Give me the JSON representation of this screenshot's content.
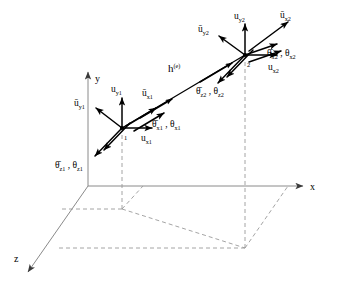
{
  "figure": {
    "type": "3d-beam-element-dof-diagram"
  },
  "axes": {
    "x_label": "x",
    "y_label": "y",
    "z_label": "z",
    "origin_label": ""
  },
  "element": {
    "length_label": "h",
    "length_superscript": "(e)",
    "node1_number": "1",
    "node2_number": "2"
  },
  "node1_dofs": {
    "u_y_bar": {
      "base": "u",
      "bar": true,
      "sub": "y1"
    },
    "u_y": {
      "base": "u",
      "bar": false,
      "sub": "y1"
    },
    "u_x_bar": {
      "base": "u",
      "bar": true,
      "sub": "x1"
    },
    "u_x": {
      "base": "u",
      "bar": false,
      "sub": "x1"
    },
    "theta_x_pair": {
      "bar_sub": "x1",
      "plain_sub": "x1"
    },
    "theta_z_pair": {
      "bar_sub": "z1",
      "plain_sub": "z1"
    }
  },
  "node2_dofs": {
    "u_y_bar": {
      "base": "u",
      "bar": true,
      "sub": "y2"
    },
    "u_y": {
      "base": "u",
      "bar": false,
      "sub": "y2"
    },
    "u_x_bar": {
      "base": "u",
      "bar": true,
      "sub": "x2"
    },
    "u_x": {
      "base": "u",
      "bar": false,
      "sub": "x2"
    },
    "theta_x_pair": {
      "bar_sub": "x2",
      "plain_sub": "x2"
    },
    "theta_z_pair": {
      "bar_sub": "z2",
      "plain_sub": "z2"
    }
  },
  "labels": {
    "uy1_bar": "ū",
    "uy1": "u",
    "ux1_bar": "ū",
    "ux1": "u",
    "uy2_bar": "ū",
    "uy2": "u",
    "ux2_bar": "ū",
    "ux2": "u",
    "theta": "θ",
    "theta_bar": "θ̄",
    "comma": " , "
  },
  "colors": {
    "background": "#ffffff",
    "axis": "#8a8a8a",
    "projection": "#9a9a9a",
    "beam": "#000000",
    "arrow": "#000000",
    "text": "#000000"
  }
}
